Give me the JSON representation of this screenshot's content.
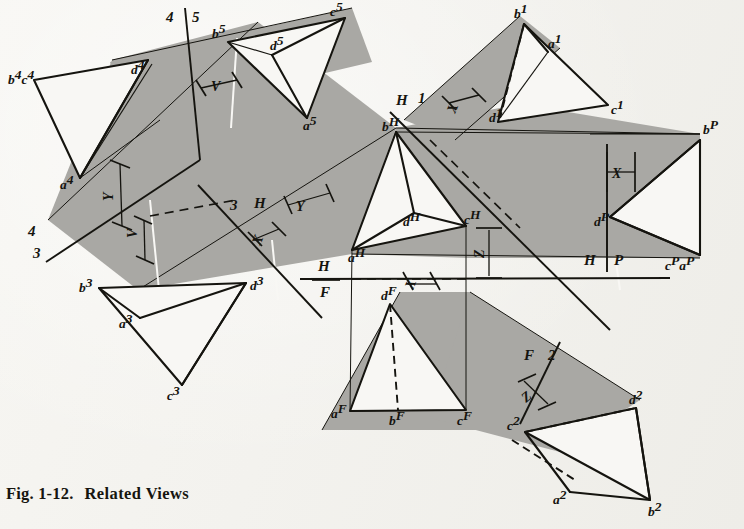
{
  "figure": {
    "caption_number": "Fig. 1-12.",
    "caption_title": "Related Views",
    "background_color": "#f6f5f1",
    "band_color": "#a9a8a4",
    "ink_color": "#15140f"
  },
  "views": {
    "view4": {
      "name": "auxiliary-view-4",
      "vertices": [
        {
          "id": "bc4",
          "label": "b",
          "sup": "4",
          "label2": "c",
          "sup2": "4",
          "x": 8,
          "y": 72
        },
        {
          "id": "d4",
          "label": "d",
          "sup": "4",
          "x": 131,
          "y": 68
        },
        {
          "id": "a4",
          "label": "a",
          "sup": "4",
          "x": 66,
          "y": 182
        }
      ]
    },
    "view5": {
      "name": "auxiliary-view-5",
      "vertices": [
        {
          "id": "b5",
          "label": "b",
          "sup": "5",
          "x": 216,
          "y": 35
        },
        {
          "id": "c5",
          "label": "c",
          "sup": "5",
          "x": 334,
          "y": 13
        },
        {
          "id": "d5",
          "label": "d",
          "sup": "5",
          "x": 276,
          "y": 46
        },
        {
          "id": "a5",
          "label": "a",
          "sup": "5",
          "x": 309,
          "y": 125
        }
      ]
    },
    "view3": {
      "name": "auxiliary-view-3",
      "vertices": [
        {
          "id": "b3",
          "label": "b",
          "sup": "3",
          "x": 86,
          "y": 287
        },
        {
          "id": "d3",
          "label": "d",
          "sup": "3",
          "x": 252,
          "y": 285
        },
        {
          "id": "a3",
          "label": "a",
          "sup": "3",
          "x": 128,
          "y": 322
        },
        {
          "id": "c3",
          "label": "c",
          "sup": "3",
          "x": 169,
          "y": 392
        }
      ]
    },
    "viewH": {
      "name": "horizontal-top-view",
      "vertices": [
        {
          "id": "bH",
          "label": "b",
          "sup": "H",
          "x": 395,
          "y": 129
        },
        {
          "id": "dH",
          "label": "d",
          "sup": "H",
          "x": 414,
          "y": 220
        },
        {
          "id": "cH",
          "label": "c",
          "sup": "H",
          "x": 466,
          "y": 226
        },
        {
          "id": "aH",
          "label": "a",
          "sup": "H",
          "x": 352,
          "y": 254
        }
      ]
    },
    "viewF": {
      "name": "frontal-front-view",
      "vertices": [
        {
          "id": "dF",
          "label": "d",
          "sup": "F",
          "x": 387,
          "y": 301
        },
        {
          "id": "aF",
          "label": "a",
          "sup": "F",
          "x": 343,
          "y": 412
        },
        {
          "id": "bF",
          "label": "b",
          "sup": "F",
          "x": 397,
          "y": 414
        },
        {
          "id": "cF",
          "label": "c",
          "sup": "F",
          "x": 464,
          "y": 413
        }
      ]
    },
    "viewP": {
      "name": "profile-view",
      "vertices": [
        {
          "id": "bP",
          "label": "b",
          "sup": "P",
          "x": 707,
          "y": 136
        },
        {
          "id": "dP",
          "label": "d",
          "sup": "P",
          "x": 601,
          "y": 219
        },
        {
          "id": "cPaP",
          "label": "c",
          "sup": "P",
          "label2": "a",
          "sup2": "P",
          "x": 671,
          "y": 262
        }
      ]
    },
    "view1": {
      "name": "auxiliary-view-1",
      "vertices": [
        {
          "id": "b1",
          "label": "b",
          "sup": "1",
          "x": 519,
          "y": 16
        },
        {
          "id": "a1",
          "label": "a",
          "sup": "1",
          "x": 551,
          "y": 43
        },
        {
          "id": "c1",
          "label": "c",
          "sup": "1",
          "x": 613,
          "y": 110
        },
        {
          "id": "d1",
          "label": "d",
          "sup": "1",
          "x": 496,
          "y": 115
        }
      ]
    },
    "view2": {
      "name": "auxiliary-view-2",
      "vertices": [
        {
          "id": "d2",
          "label": "d",
          "sup": "2",
          "x": 632,
          "y": 403
        },
        {
          "id": "c2",
          "label": "c",
          "sup": "2",
          "x": 517,
          "y": 430
        },
        {
          "id": "a2",
          "label": "a",
          "sup": "2",
          "x": 557,
          "y": 490
        },
        {
          "id": "b2",
          "label": "b",
          "sup": "2",
          "x": 654,
          "y": 508
        }
      ]
    }
  },
  "fold_lines": [
    {
      "name": "fold-4-5",
      "left": "4",
      "right": "5",
      "lx": 166,
      "ly": 17,
      "rx": 192,
      "ry": 17
    },
    {
      "name": "fold-4-3",
      "upper": "4",
      "lower": "3",
      "ux": 33,
      "uy": 230,
      "lx": 38,
      "ly": 252
    },
    {
      "name": "fold-3-H",
      "left": "3",
      "right": "H",
      "lx": 237,
      "ly": 206,
      "rx": 258,
      "ry": 203
    },
    {
      "name": "fold-H-1",
      "left": "H",
      "right": "1",
      "lx": 402,
      "ly": 100,
      "rx": 422,
      "ry": 97
    },
    {
      "name": "fold-H-F",
      "upper": "H",
      "lower": "F",
      "ux": 324,
      "uy": 265,
      "lx": 324,
      "ly": 292
    },
    {
      "name": "fold-H-P",
      "left": "H",
      "right": "P",
      "lx": 589,
      "ly": 259,
      "rx": 619,
      "ry": 259
    },
    {
      "name": "fold-F-2",
      "left": "F",
      "right": "2",
      "lx": 528,
      "ly": 355,
      "rx": 551,
      "ry": 355
    }
  ],
  "dimensions": [
    {
      "name": "dim-V-top",
      "label": "V",
      "x": 217,
      "y": 90
    },
    {
      "name": "dim-Y-left",
      "label": "Y",
      "x": 120,
      "y": 196
    },
    {
      "name": "dim-V-left",
      "label": "V",
      "x": 143,
      "y": 232
    },
    {
      "name": "dim-X-center",
      "label": "X",
      "x": 267,
      "y": 240
    },
    {
      "name": "dim-Y-center",
      "label": "Y",
      "x": 302,
      "y": 206
    },
    {
      "name": "dim-X-H1",
      "label": "X",
      "x": 461,
      "y": 108
    },
    {
      "name": "dim-X-profile",
      "label": "X",
      "x": 617,
      "y": 172
    },
    {
      "name": "dim-Z-center",
      "label": "Z",
      "x": 490,
      "y": 252
    },
    {
      "name": "dim-X-front",
      "label": "X",
      "x": 419,
      "y": 284
    },
    {
      "name": "dim-Z-front",
      "label": "Z",
      "x": 532,
      "y": 397
    }
  ]
}
